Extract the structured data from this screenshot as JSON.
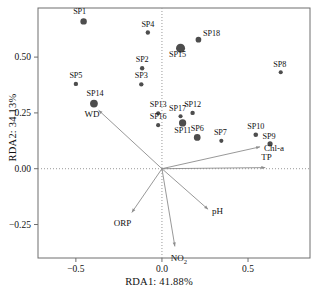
{
  "chart_data": {
    "type": "scatter",
    "title": "",
    "xlabel": "RDA1: 41.88%",
    "ylabel": "RDA2: 34.13%",
    "xlim": [
      -0.72,
      0.86
    ],
    "ylim": [
      -0.4,
      0.72
    ],
    "xticks": [
      -0.5,
      0.0,
      0.5
    ],
    "xtick_labels": [
      "−0.5",
      "0.0",
      "0.5"
    ],
    "yticks": [
      0.5,
      0.25,
      0.0,
      -0.25
    ],
    "ytick_labels": [
      "0.50",
      "0.25",
      "0.00",
      "−0.25"
    ],
    "grid": "dotted-zero-lines",
    "legend": "none",
    "point_color": "#4d4d4d",
    "arrow_color": "#8c8c8c",
    "axis_color": "#6e6e6e",
    "series": [
      {
        "name": "Samples",
        "marker": "circle",
        "points": [
          {
            "label": "SP1",
            "x": -0.455,
            "y": 0.66,
            "size": 5.0,
            "label_dx": -4,
            "label_dy": -9
          },
          {
            "label": "SP2",
            "x": -0.115,
            "y": 0.45,
            "size": 3.4,
            "label_dx": 0,
            "label_dy": -8
          },
          {
            "label": "SP3",
            "x": -0.12,
            "y": 0.378,
            "size": 3.4,
            "label_dx": 0,
            "label_dy": -8
          },
          {
            "label": "SP4",
            "x": -0.082,
            "y": 0.61,
            "size": 3.4,
            "label_dx": 0,
            "label_dy": -8
          },
          {
            "label": "SP5",
            "x": -0.5,
            "y": 0.38,
            "size": 3.4,
            "label_dx": 0,
            "label_dy": -8
          },
          {
            "label": "SP6",
            "x": 0.205,
            "y": 0.14,
            "size": 5.2,
            "label_dx": 0,
            "label_dy": -8
          },
          {
            "label": "SP7",
            "x": 0.345,
            "y": 0.125,
            "size": 3.2,
            "label_dx": -1,
            "label_dy": -8
          },
          {
            "label": "SP8",
            "x": 0.69,
            "y": 0.432,
            "size": 3.2,
            "label_dx": -1,
            "label_dy": -7
          },
          {
            "label": "SP9",
            "x": 0.628,
            "y": 0.112,
            "size": 4.0,
            "label_dx": -1,
            "label_dy": -7
          },
          {
            "label": "SP10",
            "x": 0.545,
            "y": 0.152,
            "size": 3.6,
            "label_dx": 0,
            "label_dy": -8
          },
          {
            "label": "SP11",
            "x": 0.12,
            "y": 0.205,
            "size": 5.6,
            "label_dx": 0,
            "label_dy": 8
          },
          {
            "label": "SP12",
            "x": 0.178,
            "y": 0.25,
            "size": 3.4,
            "label_dx": 0,
            "label_dy": -8
          },
          {
            "label": "SP13",
            "x": -0.022,
            "y": 0.248,
            "size": 3.2,
            "label_dx": 0,
            "label_dy": -8
          },
          {
            "label": "SP14",
            "x": -0.395,
            "y": 0.292,
            "size": 6.0,
            "label_dx": 1,
            "label_dy": -10
          },
          {
            "label": "SP15",
            "x": 0.108,
            "y": 0.54,
            "size": 7.0,
            "label_dx": -3,
            "label_dy": 7
          },
          {
            "label": "SP16",
            "x": -0.022,
            "y": 0.195,
            "size": 3.2,
            "label_dx": 0,
            "label_dy": -8
          },
          {
            "label": "SP17",
            "x": 0.108,
            "y": 0.235,
            "size": 3.2,
            "label_dx": -3,
            "label_dy": -7
          },
          {
            "label": "SP18",
            "x": 0.212,
            "y": 0.578,
            "size": 4.4,
            "label_dx": 13,
            "label_dy": -6
          }
        ]
      }
    ],
    "vectors": [
      {
        "label": "WD",
        "x": -0.368,
        "y": 0.262,
        "label_dx": -14,
        "label_dy": 5
      },
      {
        "label": "ORP",
        "x": -0.175,
        "y": -0.196,
        "label_dx": -18,
        "label_dy": 12
      },
      {
        "label": "NO2",
        "x": 0.075,
        "y": -0.348,
        "label_dx": -4,
        "label_dy": 13,
        "html": "NO<sub>2</sub>"
      },
      {
        "label": "pH",
        "x": 0.268,
        "y": -0.182,
        "label_dx": 4,
        "label_dy": 3
      },
      {
        "label": "TP",
        "x": 0.6,
        "y": 0.005,
        "label_dx": -4,
        "label_dy": -10
      },
      {
        "label": "Chl-a",
        "x": 0.57,
        "y": 0.098,
        "label_dx": 4,
        "label_dy": 2
      }
    ]
  }
}
